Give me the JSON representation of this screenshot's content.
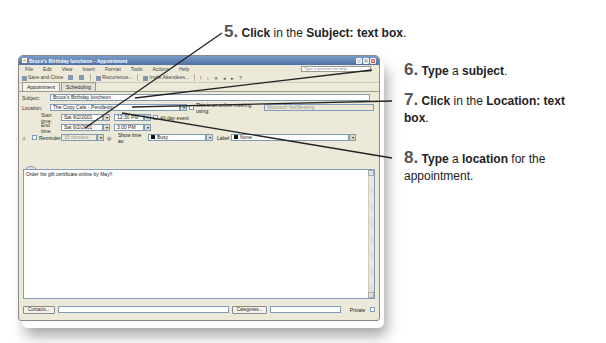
{
  "window": {
    "title": "Bruce's Birthday luncheon - Appointment",
    "controls": [
      "_",
      "□",
      "×"
    ]
  },
  "menubar": {
    "items": [
      "File",
      "Edit",
      "View",
      "Insert",
      "Format",
      "Tools",
      "Actions",
      "Help"
    ],
    "help_placeholder": "Type a question for help"
  },
  "toolbar": {
    "save_close": "Save and Close",
    "recurrence": "Recurrence...",
    "invite": "Invite Attendees...",
    "icons": [
      "save-icon",
      "print-icon",
      "attach-icon",
      "recurrence-icon",
      "invite-icon",
      "importance-high-icon",
      "importance-low-icon",
      "delete-icon",
      "previous-icon",
      "next-icon",
      "help-icon"
    ]
  },
  "tabs": [
    {
      "label": "Appointment",
      "active": true
    },
    {
      "label": "Scheduling",
      "active": false
    }
  ],
  "form": {
    "subject_label": "Subject:",
    "subject_value": "Bruce's Birthday luncheon",
    "location_label": "Location:",
    "location_value": "The Copy Cafe - Pendleton",
    "online_meeting_label": "This is an online meeting using:",
    "online_meeting_value": "Microsoft NetMeeting",
    "start_label": "Start time:",
    "start_date": "Sat 6/2/2001",
    "start_time": "12:30 PM",
    "all_day_label": "All day event",
    "end_label": "End time:",
    "end_date": "Sat 6/2/2001",
    "end_time": "3:00 PM",
    "reminder_label": "Reminder:",
    "reminder_value": "15 minutes",
    "show_time_label": "Show time as:",
    "show_time_value": "Busy",
    "label_label": "Label:",
    "label_value": "None",
    "notes": "Order his gift certificate online by May!!",
    "contacts_button": "Contacts...",
    "categories_button": "Categories...",
    "private_label": "Private"
  },
  "callouts": [
    {
      "num": "5.",
      "parts": [
        [
          "b",
          "Click"
        ],
        [
          "t",
          " in the "
        ],
        [
          "b",
          "Subject: text box"
        ],
        [
          "t",
          "."
        ]
      ]
    },
    {
      "num": "6.",
      "parts": [
        [
          "b",
          "Type"
        ],
        [
          "t",
          " a "
        ],
        [
          "b",
          "subject"
        ],
        [
          "t",
          "."
        ]
      ]
    },
    {
      "num": "7.",
      "parts": [
        [
          "b",
          "Click"
        ],
        [
          "t",
          " in the "
        ],
        [
          "b",
          "Location: text"
        ]
      ],
      "line2": [
        [
          "b",
          "box"
        ],
        [
          "t",
          "."
        ]
      ]
    },
    {
      "num": "8.",
      "parts": [
        [
          "b",
          "Type"
        ],
        [
          "t",
          " a "
        ],
        [
          "b",
          "location"
        ],
        [
          "t",
          " for the"
        ]
      ],
      "line2": [
        [
          "t",
          "appointment."
        ]
      ]
    }
  ]
}
